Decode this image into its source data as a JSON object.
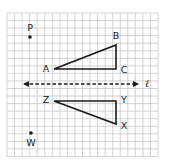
{
  "diagram": {
    "type": "reflection-on-grid",
    "grid": {
      "x0": 7,
      "y0": 13,
      "cell": 7.55,
      "cols": 20,
      "rows": 19,
      "line_color": "#c8c8c8",
      "background": "#ffffff"
    },
    "line_of_reflection": {
      "label": "ℓ",
      "y": 84,
      "x_start": 24,
      "x_end": 138,
      "style": "dashed",
      "arrows": "both",
      "label_x": 147,
      "label_y": 84
    },
    "points": {
      "P": {
        "label": "P",
        "x": 30,
        "y": 37,
        "label_x": 30,
        "label_y": 28
      },
      "W": {
        "label": "W",
        "x": 31,
        "y": 133,
        "label_x": 31,
        "label_y": 143
      }
    },
    "triangles": [
      {
        "name": "triangle-ABC",
        "vertices": [
          {
            "label": "A",
            "x": 54,
            "y": 69,
            "label_x": 46,
            "label_y": 69
          },
          {
            "label": "B",
            "x": 116,
            "y": 45,
            "label_x": 116,
            "label_y": 36
          },
          {
            "label": "C",
            "x": 116,
            "y": 69,
            "label_x": 124,
            "label_y": 70
          }
        ]
      },
      {
        "name": "triangle-XYZ",
        "vertices": [
          {
            "label": "Z",
            "x": 54,
            "y": 101,
            "label_x": 46,
            "label_y": 100
          },
          {
            "label": "Y",
            "x": 116,
            "y": 101,
            "label_x": 124,
            "label_y": 100
          },
          {
            "label": "X",
            "x": 116,
            "y": 124,
            "label_x": 124,
            "label_y": 126
          }
        ]
      }
    ],
    "stroke_color": "#1a1a1a"
  }
}
